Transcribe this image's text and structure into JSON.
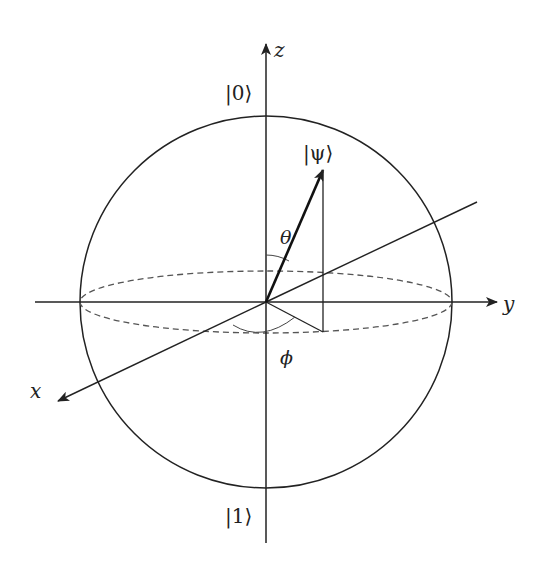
{
  "diagram": {
    "axes": {
      "z_label": "z",
      "y_label": "y",
      "x_label": "x"
    },
    "states": {
      "north": "|0⟩",
      "south": "|1⟩",
      "psi": "|ψ⟩"
    },
    "angles": {
      "polar": "θ",
      "azimuthal": "ϕ"
    },
    "colors": {
      "stroke": "#222222",
      "dashed": "#555555",
      "background": "#ffffff"
    }
  }
}
